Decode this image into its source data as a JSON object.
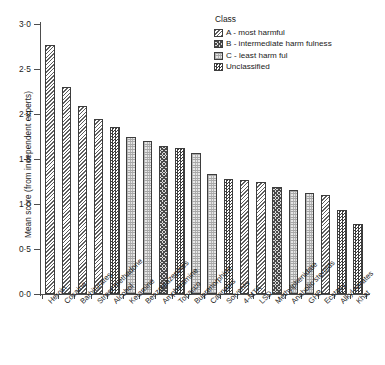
{
  "chart_data": {
    "type": "bar",
    "title": "",
    "xlabel": "",
    "ylabel": "Mean score (from independent experts)",
    "ylim": [
      0.0,
      3.0
    ],
    "ytick_labels": [
      "3·0",
      "2·5",
      "2·0",
      "1·5",
      "1·0",
      "0·5",
      "0·0"
    ],
    "ytick_values": [
      3.0,
      2.5,
      2.0,
      1.5,
      1.0,
      0.5,
      0.0
    ],
    "grid": false,
    "legend_position": "top-right",
    "categories": [
      "Heroin",
      "Cocaine",
      "Barbiturates",
      "Street methadone",
      "Alcohol",
      "Ketamine",
      "Benzodiazepines",
      "Amphetamine",
      "Tobacco",
      "Buprenorphine",
      "Cannabis",
      "Solvents",
      "4-MTA",
      "LSD",
      "Methylphenidate",
      "Anabolic steroids",
      "GHB",
      "Ecstasy",
      "Alkyl nitrates",
      "Khat"
    ],
    "values": [
      2.77,
      2.3,
      2.09,
      1.94,
      1.86,
      1.75,
      1.7,
      1.65,
      1.62,
      1.57,
      1.33,
      1.28,
      1.27,
      1.24,
      1.19,
      1.16,
      1.12,
      1.1,
      0.93,
      0.78
    ],
    "classes": [
      "A",
      "A",
      "A",
      "A",
      "Unclassified",
      "C",
      "C",
      "B",
      "Unclassified",
      "C",
      "C",
      "Unclassified",
      "A",
      "A",
      "B",
      "C",
      "C",
      "A",
      "Unclassified",
      "Unclassified"
    ]
  },
  "legend": {
    "title": "Class",
    "items": [
      {
        "key": "A",
        "label": "A - most harmful"
      },
      {
        "key": "B",
        "label": "B - intermediate harm fulness"
      },
      {
        "key": "C",
        "label": "C - least harm ful"
      },
      {
        "key": "Unclassified",
        "label": "Unclassified"
      }
    ]
  },
  "colors": {
    "axis": "#4d4d4d",
    "bar_outline": "#3d3d3d",
    "text": "#1a1a1a",
    "background": "#ffffff"
  }
}
